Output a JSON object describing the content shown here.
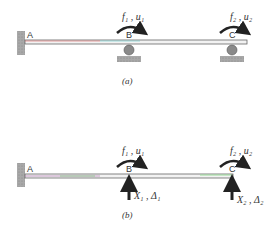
{
  "figure_a": {
    "caption": "(a)",
    "nodes": {
      "A": "A",
      "B": "B",
      "C": "C"
    },
    "loads": [
      {
        "node": "B",
        "label": "f₁ , u₁"
      },
      {
        "node": "C",
        "label": "f₂ , u₂"
      }
    ],
    "supports": {
      "A": "fixed",
      "B": "roller",
      "C": "roller"
    }
  },
  "figure_b": {
    "caption": "(b)",
    "nodes": {
      "A": "A",
      "B": "B",
      "C": "C"
    },
    "loads": [
      {
        "node": "B",
        "label": "f₁ , u₁"
      },
      {
        "node": "C",
        "label": "f₂ , u₂"
      }
    ],
    "redundants": [
      {
        "node": "B",
        "label": "X₁ , Δ₁"
      },
      {
        "node": "C",
        "label": "X₂ , Δ₂"
      }
    ],
    "supports": {
      "A": "fixed"
    }
  },
  "colors": {
    "beam": "#6a6a6a",
    "support": "#9a9a9a",
    "ink": "#333333"
  }
}
